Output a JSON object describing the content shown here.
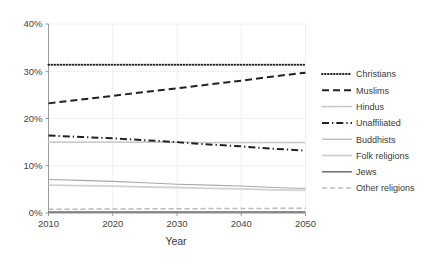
{
  "chart_data": {
    "type": "line",
    "title": "",
    "subtitle": "",
    "xlabel": "Year",
    "ylabel": "",
    "x": [
      2010,
      2015,
      2020,
      2025,
      2030,
      2035,
      2040,
      2045,
      2050
    ],
    "xlim": [
      2010,
      2050
    ],
    "ylim": [
      0,
      40
    ],
    "xticks": [
      "2010",
      "2020",
      "2030",
      "2040",
      "2050"
    ],
    "yticks": [
      "0%",
      "10%",
      "20%",
      "30%",
      "40%"
    ],
    "ytick_values": [
      0,
      10,
      20,
      30,
      40
    ],
    "xtick_values": [
      2010,
      2020,
      2030,
      2040,
      2050
    ],
    "grid": true,
    "grid_color": "#e8e8e8",
    "legend_position": "right",
    "series": [
      {
        "name": "Christians",
        "values": [
          31.4,
          31.4,
          31.4,
          31.4,
          31.4,
          31.4,
          31.4,
          31.4,
          31.4
        ],
        "style": "dotted",
        "color": "#222222",
        "width": 2.0,
        "dash": "0.6,2.4"
      },
      {
        "name": "Muslims",
        "values": [
          23.2,
          24.0,
          24.8,
          25.6,
          26.4,
          27.2,
          28.0,
          28.9,
          29.7
        ],
        "style": "dashed",
        "color": "#222222",
        "width": 2.0,
        "dash": "7,4"
      },
      {
        "name": "Hindus",
        "values": [
          15.0,
          15.0,
          15.0,
          15.0,
          15.0,
          14.9,
          14.9,
          14.9,
          14.9
        ],
        "style": "fine-dotted",
        "color": "#c4c4c4",
        "width": 1.6,
        "dash": "0.7,1.5"
      },
      {
        "name": "Unaffiliated",
        "values": [
          16.4,
          16.1,
          15.8,
          15.4,
          15.0,
          14.5,
          14.1,
          13.6,
          13.2
        ],
        "style": "dash-dot",
        "color": "#222222",
        "width": 2.0,
        "dash": "7,3,1.3,3"
      },
      {
        "name": "Buddhists",
        "values": [
          7.1,
          6.9,
          6.7,
          6.4,
          6.1,
          5.9,
          5.7,
          5.4,
          5.2
        ],
        "style": "solid",
        "color": "#a8a8a8",
        "width": 1.1,
        "dash": "none"
      },
      {
        "name": "Folk religions",
        "values": [
          5.9,
          5.8,
          5.7,
          5.5,
          5.4,
          5.2,
          5.1,
          4.9,
          4.8
        ],
        "style": "solid",
        "color": "#d2d2d2",
        "width": 1.8,
        "dash": "none"
      },
      {
        "name": "Jews",
        "values": [
          0.2,
          0.2,
          0.2,
          0.2,
          0.2,
          0.2,
          0.2,
          0.2,
          0.2
        ],
        "style": "solid",
        "color": "#6d6d6d",
        "width": 1.5,
        "dash": "none"
      },
      {
        "name": "Other religions",
        "values": [
          0.8,
          0.82,
          0.85,
          0.88,
          0.9,
          0.93,
          0.95,
          0.98,
          1.0
        ],
        "style": "dashed",
        "color": "#b9b9b9",
        "width": 1.5,
        "dash": "5,3"
      }
    ]
  },
  "legend": {
    "items": [
      {
        "label": "Christians"
      },
      {
        "label": "Muslims"
      },
      {
        "label": "Hindus"
      },
      {
        "label": "Unaffiliated"
      },
      {
        "label": "Buddhists"
      },
      {
        "label": "Folk religions"
      },
      {
        "label": "Jews"
      },
      {
        "label": "Other religions"
      }
    ]
  },
  "axes": {
    "x_title": "Year",
    "y_labels": [
      "40%",
      "30%",
      "20%",
      "10%",
      "0%"
    ],
    "x_labels": [
      "2010",
      "2020",
      "2030",
      "2040",
      "2050"
    ]
  },
  "colors": {
    "axis": "#9a9a9a",
    "grid": "#ececec",
    "text": "#3a3a3a",
    "background": "#ffffff"
  }
}
